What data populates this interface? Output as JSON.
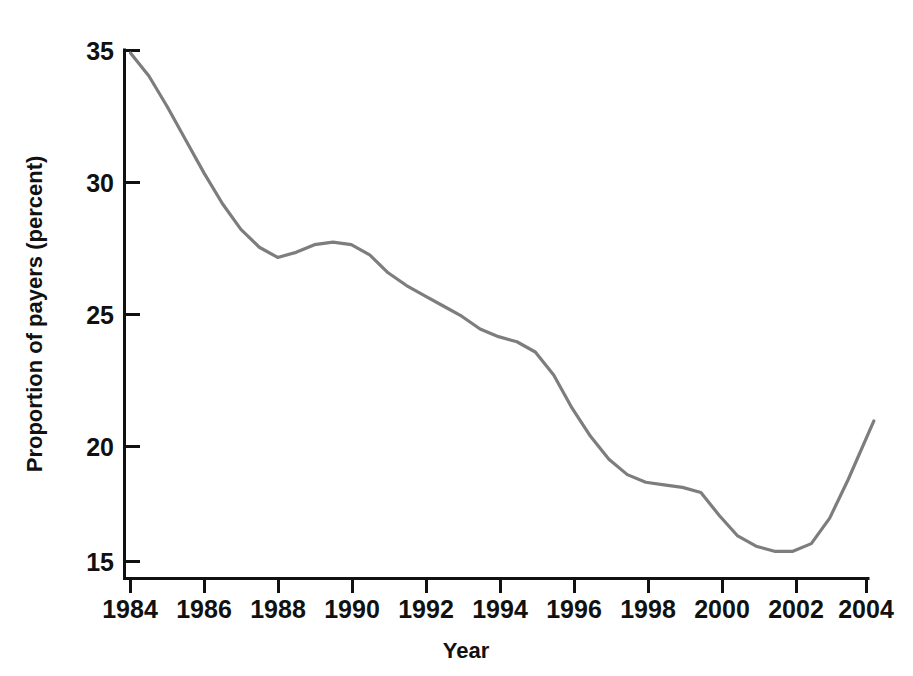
{
  "chart_data": {
    "type": "line",
    "title": "",
    "subtitle": "",
    "xlabel": "Year",
    "ylabel": "Proportion of payers (percent)",
    "xlim": [
      1983.6,
      2004.5
    ],
    "ylim": [
      14.6,
      35.4
    ],
    "grid": false,
    "legend": false,
    "legend_position": "none",
    "line_color": "#7d7d7d",
    "axis_color": "#111111",
    "background_color": "#ffffff",
    "x_ticks": [
      "1984",
      "1986",
      "1988",
      "1990",
      "1992",
      "1994",
      "1996",
      "1998",
      "2000",
      "2002",
      "2004"
    ],
    "x_tick_values": [
      1984,
      1986,
      1988,
      1990,
      1992,
      1994,
      1996,
      1998,
      2000,
      2002,
      2004
    ],
    "y_ticks": [
      "15",
      "20",
      "25",
      "30",
      "35"
    ],
    "y_tick_values": [
      15,
      20,
      25,
      30,
      35
    ],
    "x": [
      1984.0,
      1984.5,
      1985.0,
      1985.5,
      1986.0,
      1986.5,
      1987.0,
      1987.5,
      1988.0,
      1988.5,
      1989.0,
      1989.5,
      1990.0,
      1990.5,
      1991.0,
      1991.5,
      1992.0,
      1992.5,
      1993.0,
      1993.5,
      1994.0,
      1994.5,
      1995.0,
      1995.5,
      1996.0,
      1996.5,
      1997.0,
      1997.5,
      1998.0,
      1998.5,
      1999.0,
      1999.5,
      2000.0,
      2000.5,
      2001.0,
      2001.5,
      2002.0,
      2002.5,
      2003.0,
      2003.5,
      2004.2
    ],
    "values": [
      34.9,
      34.0,
      32.8,
      31.5,
      30.2,
      29.0,
      28.0,
      27.3,
      26.9,
      27.1,
      27.4,
      27.5,
      27.4,
      27.0,
      26.3,
      25.8,
      25.4,
      25.0,
      24.6,
      24.1,
      23.8,
      23.6,
      23.2,
      22.3,
      21.0,
      19.9,
      19.0,
      18.4,
      18.1,
      18.0,
      17.9,
      17.7,
      16.8,
      16.0,
      15.6,
      15.4,
      15.4,
      15.7,
      16.7,
      18.2,
      20.5
    ],
    "series": [
      {
        "name": "Proportion of payers",
        "color": "#7d7d7d",
        "values": [
          34.9,
          34.0,
          32.8,
          31.5,
          30.2,
          29.0,
          28.0,
          27.3,
          26.9,
          27.1,
          27.4,
          27.5,
          27.4,
          27.0,
          26.3,
          25.8,
          25.4,
          25.0,
          24.6,
          24.1,
          23.8,
          23.6,
          23.2,
          22.3,
          21.0,
          19.9,
          19.0,
          18.4,
          18.1,
          18.0,
          17.9,
          17.7,
          16.8,
          16.0,
          15.6,
          15.4,
          15.4,
          15.7,
          16.7,
          18.2,
          20.5
        ]
      }
    ],
    "annotations": [],
    "notes": {
      "start_value": "34.9",
      "start_year": "1984",
      "end_value": "20.5",
      "end_year": "2004",
      "minimum_value": "15.4",
      "minimum_year": "2001.5",
      "local_max_value": "27.5",
      "local_max_year": "1989.5"
    }
  }
}
